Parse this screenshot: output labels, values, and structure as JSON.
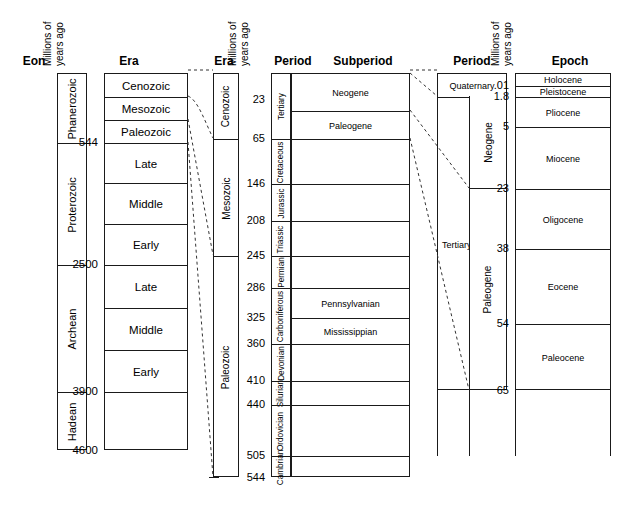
{
  "figure": {
    "scale_header_line1": "Millions of",
    "scale_header_line2": "years ago"
  },
  "block1": {
    "headers": {
      "eon": "Eon",
      "era": "Era"
    },
    "eons": [
      {
        "label": "Phanerozoic",
        "top": 73,
        "bottom": 142
      },
      {
        "label": "Proterozoic",
        "top": 142,
        "bottom": 264
      },
      {
        "label": "Archean",
        "top": 264,
        "bottom": 391
      },
      {
        "label": "Hadean",
        "top": 391,
        "bottom": 450
      }
    ],
    "eras": [
      {
        "label": "Cenozoic",
        "top": 73,
        "bottom": 96
      },
      {
        "label": "Mesozoic",
        "top": 96,
        "bottom": 119
      },
      {
        "label": "Paleozoic",
        "top": 119,
        "bottom": 142
      },
      {
        "label": "Late",
        "top": 142,
        "bottom": 182
      },
      {
        "label": "Middle",
        "top": 182,
        "bottom": 223
      },
      {
        "label": "Early",
        "top": 223,
        "bottom": 264
      },
      {
        "label": "Late",
        "top": 264,
        "bottom": 307
      },
      {
        "label": "Middle",
        "top": 307,
        "bottom": 349
      },
      {
        "label": "Early",
        "top": 349,
        "bottom": 391
      },
      {
        "label": "",
        "top": 391,
        "bottom": 450
      }
    ],
    "ticks": [
      {
        "value": "544",
        "y": 142
      },
      {
        "value": "2500",
        "y": 264
      },
      {
        "value": "3900",
        "y": 391
      },
      {
        "value": "4600",
        "y": 450
      }
    ]
  },
  "block2": {
    "headers": {
      "era": "Era",
      "period": "Period",
      "subperiod": "Subperiod"
    },
    "eras": [
      {
        "label": "Cenozoic",
        "top": 73,
        "bottom": 138
      },
      {
        "label": "Mesozoic",
        "top": 138,
        "bottom": 255
      },
      {
        "label": "Paleozoic",
        "top": 255,
        "bottom": 477
      }
    ],
    "periods": [
      {
        "label": "Tertiary",
        "top": 73,
        "bottom": 138
      },
      {
        "label": "Cretaceous",
        "top": 138,
        "bottom": 183
      },
      {
        "label": "Jurassic",
        "top": 183,
        "bottom": 220
      },
      {
        "label": "Triassic",
        "top": 220,
        "bottom": 255
      },
      {
        "label": "Permian",
        "top": 255,
        "bottom": 287
      },
      {
        "label": "Carboniferous",
        "top": 287,
        "bottom": 343
      },
      {
        "label": "Devonian",
        "top": 343,
        "bottom": 380
      },
      {
        "label": "Silurian",
        "top": 380,
        "bottom": 404
      },
      {
        "label": "Ordovician",
        "top": 404,
        "bottom": 455
      },
      {
        "label": "Cambrian",
        "top": 455,
        "bottom": 477
      }
    ],
    "subperiods": [
      {
        "label": "Neogene",
        "top": 73,
        "bottom": 110
      },
      {
        "label": "Paleogene",
        "top": 110,
        "bottom": 138
      },
      {
        "label": "",
        "top": 138,
        "bottom": 183
      },
      {
        "label": "",
        "top": 183,
        "bottom": 220
      },
      {
        "label": "",
        "top": 220,
        "bottom": 255
      },
      {
        "label": "",
        "top": 255,
        "bottom": 287
      },
      {
        "label": "Pennsylvanian",
        "top": 287,
        "bottom": 317
      },
      {
        "label": "Mississippian",
        "top": 317,
        "bottom": 343
      },
      {
        "label": "",
        "top": 343,
        "bottom": 380
      },
      {
        "label": "",
        "top": 380,
        "bottom": 404
      },
      {
        "label": "",
        "top": 404,
        "bottom": 455
      },
      {
        "label": "",
        "top": 455,
        "bottom": 477
      }
    ],
    "ticks": [
      {
        "value": "23",
        "y": 99
      },
      {
        "value": "65",
        "y": 138
      },
      {
        "value": "146",
        "y": 183
      },
      {
        "value": "208",
        "y": 220
      },
      {
        "value": "245",
        "y": 255
      },
      {
        "value": "286",
        "y": 287
      },
      {
        "value": "325",
        "y": 317
      },
      {
        "value": "360",
        "y": 343
      },
      {
        "value": "410",
        "y": 380
      },
      {
        "value": "440",
        "y": 404
      },
      {
        "value": "505",
        "y": 455
      },
      {
        "value": "544",
        "y": 477
      }
    ]
  },
  "block3": {
    "headers": {
      "period": "Period",
      "epoch": "Epoch"
    },
    "periods": [
      {
        "label": "Quaternary",
        "top": 73,
        "bottom": 96,
        "vertical": false
      },
      {
        "label": "Tertiary",
        "top": 96,
        "bottom": 390,
        "vertical": false
      }
    ],
    "subperiods": [
      {
        "label": "Neogene",
        "top": 96,
        "bottom": 188
      },
      {
        "label": "Paleogene",
        "top": 188,
        "bottom": 390
      }
    ],
    "epochs": [
      {
        "label": "Holocene",
        "top": 73,
        "bottom": 85
      },
      {
        "label": "Pleistocene",
        "top": 85,
        "bottom": 96
      },
      {
        "label": "Pliocene",
        "top": 96,
        "bottom": 126
      },
      {
        "label": "Miocene",
        "top": 126,
        "bottom": 188
      },
      {
        "label": "Oligocene",
        "top": 188,
        "bottom": 248
      },
      {
        "label": "Eocene",
        "top": 248,
        "bottom": 323
      },
      {
        "label": "Paleocene",
        "top": 323,
        "bottom": 390
      }
    ],
    "ticks": [
      {
        "value": ".01",
        "y": 85
      },
      {
        "value": "1.8",
        "y": 96
      },
      {
        "value": "5",
        "y": 126
      },
      {
        "value": "23",
        "y": 188
      },
      {
        "value": "38",
        "y": 248
      },
      {
        "value": "54",
        "y": 323
      },
      {
        "value": "65",
        "y": 390
      }
    ]
  },
  "connectors": {
    "description": "dashed expansion lines linking each block to its magnified neighbour",
    "color": "#333333"
  }
}
